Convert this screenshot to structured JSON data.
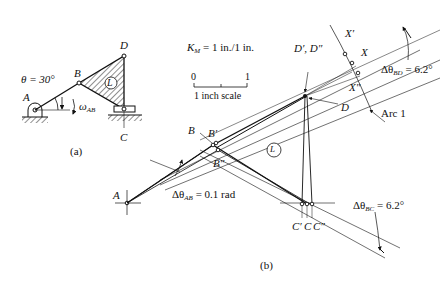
{
  "figure_a": {
    "caption": "(a)",
    "theta_label": "θ = 30°",
    "omega_label": "ω",
    "omega_sub": "AB",
    "points": {
      "A": "A",
      "B": "B",
      "C": "C",
      "D": "D"
    },
    "link_label": "L"
  },
  "figure_b": {
    "caption": "(b)",
    "scale_factor": "K",
    "scale_factor_sub": "M",
    "scale_factor_value": "= 1 in./1 in.",
    "scale_bar": {
      "start": "0",
      "end": "1",
      "label": "1 inch scale"
    },
    "points": {
      "A": "A",
      "B": "B",
      "B_prime": "B′",
      "B_dprime": "B″",
      "C": "C",
      "C_prime": "C′",
      "C_dprime": "C″",
      "D": "D",
      "D_primes": "D′, D″",
      "X": "X",
      "X_prime": "X′",
      "X_dprime": "X″"
    },
    "link_label": "L",
    "arc_label": "Arc 1",
    "delta_AB": {
      "prefix": "Δθ",
      "sub": "AB",
      "value": "= 0.1 rad"
    },
    "delta_BD": {
      "prefix": "Δθ",
      "sub": "BD",
      "value": "= 6.2°"
    },
    "delta_BC": {
      "prefix": "Δθ",
      "sub": "BC",
      "value": "= 6.2°"
    }
  }
}
